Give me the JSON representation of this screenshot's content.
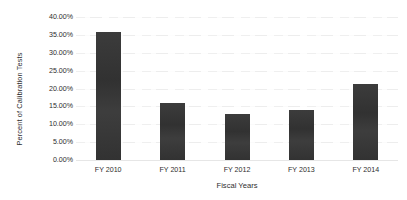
{
  "chart_data": {
    "type": "bar",
    "title": "",
    "subtitle": "",
    "xlabel": "Fiscal Years",
    "ylabel": "Percent of Calibration Tests",
    "categories": [
      "FY 2010",
      "FY 2011",
      "FY 2012",
      "FY 2013",
      "FY 2014"
    ],
    "values": [
      35.7,
      15.9,
      12.9,
      14.0,
      21.3
    ],
    "value_labels": [
      "35.70%",
      "15.90%",
      "12.90%",
      "14.00%",
      "21.30%"
    ],
    "ylim": [
      0,
      40
    ],
    "ytick_step": 5,
    "ytick_labels": [
      "40.00%",
      "35.00%",
      "30.00%",
      "25.00%",
      "20.00%",
      "15.00%",
      "10.00%",
      "5.00%",
      "0.00%"
    ],
    "ytick_values": [
      40,
      35,
      30,
      25,
      20,
      15,
      10,
      5,
      0
    ],
    "grid": true,
    "grid_axis": "y",
    "legend": false,
    "legend_position": "none",
    "series": [
      {
        "name": "Percent of Calibration Tests",
        "values": [
          35.7,
          15.9,
          12.9,
          14.0,
          21.3
        ],
        "color": "#333333"
      }
    ],
    "colors": {
      "bar": "#333333",
      "grid": "#f2f2f2",
      "axis": "#e6e6e6",
      "text": "#2e2e2e",
      "background": "#ffffff"
    },
    "annotations": []
  }
}
